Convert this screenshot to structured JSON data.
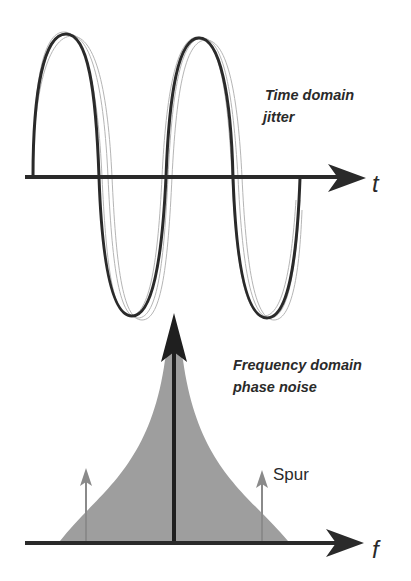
{
  "time_domain": {
    "title_line1": "Time domain",
    "title_line2": "jitter",
    "axis_label": "t"
  },
  "frequency_domain": {
    "title_line1": "Frequency domain",
    "title_line2": "phase noise",
    "axis_label": "f",
    "spur_label": "Spur"
  },
  "colors": {
    "ink": "#2a2a2a",
    "noise_fill": "#9e9e9e",
    "spur_arrow": "#8a8a8a",
    "jitter_ghost": "#b0b0b0"
  }
}
